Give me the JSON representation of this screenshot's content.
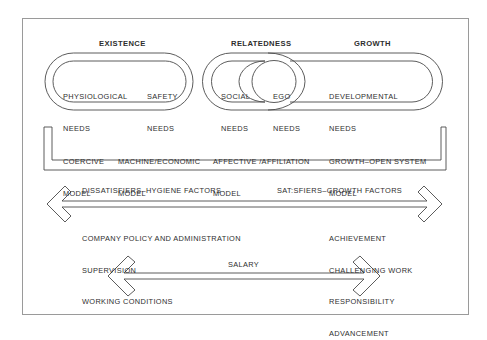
{
  "headers": {
    "existence": "EXISTENCE",
    "relatedness": "RELATEDNESS",
    "growth": "GROWTH"
  },
  "needs": {
    "physiological": [
      "PHYSIOLOGICAL",
      "NEEDS"
    ],
    "safety": [
      "SAFETY",
      "NEEDS"
    ],
    "social": [
      "SOCIAL",
      "NEEDS"
    ],
    "ego": [
      "EGO",
      "NEEDS"
    ],
    "developmental": [
      "DEVELOPMENTAL",
      "NEEDS"
    ]
  },
  "models": [
    {
      "line1": "COERCIVE",
      "line2": "MODEL"
    },
    {
      "line1": "MACHINE/ECONOMIC",
      "line2": "MODEL"
    },
    {
      "line1": "AFFECTIVE /AFFILIATION",
      "line2": "MODEL"
    },
    {
      "line1": "GROWTH–OPEN SYSTEM",
      "line2": "MODEL"
    }
  ],
  "factors": {
    "dissatisfiers_title": "DISSATISFIERS–HYGIENE FACTORS",
    "satisfiers_title": "SAT:SFIERS–GROWTH FACTORS",
    "dissatisfiers": [
      "COMPANY POLICY AND ADMINISTRATION",
      "SUPERVISION",
      "WORKING CONDITIONS"
    ],
    "satisfiers": [
      "ACHIEVEMENT",
      "CHALLENGING WORK",
      "RESPONSIBILITY",
      "ADVANCEMENT"
    ]
  },
  "salary": "SALARY",
  "colors": {
    "stroke": "#4a4a4a",
    "frame": "#9a9a9a",
    "text": "#2e2e2e"
  }
}
